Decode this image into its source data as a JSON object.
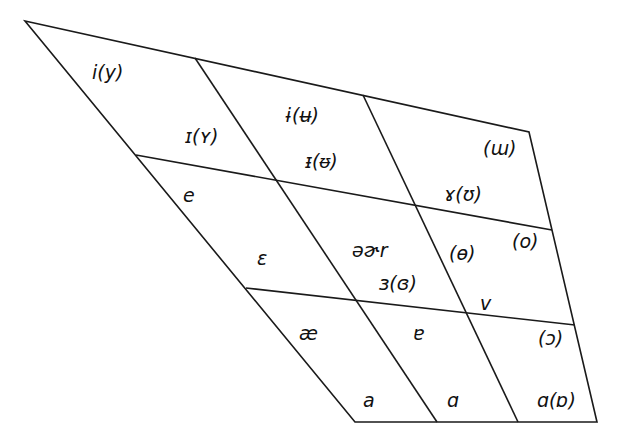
{
  "diagram": {
    "type": "vowel-quadrilateral",
    "stroke_color": "#1a1a1a",
    "background": "#ffffff",
    "outline": [
      [
        25,
        21
      ],
      [
        529,
        132
      ],
      [
        597,
        422
      ],
      [
        355,
        422
      ]
    ],
    "dividers": [
      {
        "id": "col-1",
        "from": [
          195,
          58
        ],
        "to": [
          437,
          422
        ]
      },
      {
        "id": "col-2",
        "from": [
          363,
          95
        ],
        "to": [
          518,
          422
        ]
      },
      {
        "id": "row-1",
        "from": [
          136,
          155
        ],
        "to": [
          552,
          230
        ]
      },
      {
        "id": "row-2",
        "from": [
          246,
          288
        ],
        "to": [
          575,
          325
        ]
      }
    ]
  },
  "labels": {
    "close_front": "i(y)",
    "near_close_front": "ɪ(ʏ)",
    "close_central": "ɨ(ʉ)",
    "near_close_central": "ᵻ(ᵿ)",
    "close_back": "(ɯ)",
    "near_close_back": "ɤ(ʊ)",
    "close_mid_front": "e",
    "open_mid_front": "ɛ",
    "mid_central": "əɚr",
    "open_mid_central": "ɜ(ɞ)",
    "mid_central_rounded": "(ɵ)",
    "close_mid_back": "(o)",
    "open_mid_back_unrounded": "ʌ",
    "near_open_front": "æ",
    "near_open_central": "ɐ",
    "open_mid_back": "(ɔ)",
    "open_front": "a",
    "open_central": "ɑ",
    "open_back": "ɑ(ɒ)"
  }
}
